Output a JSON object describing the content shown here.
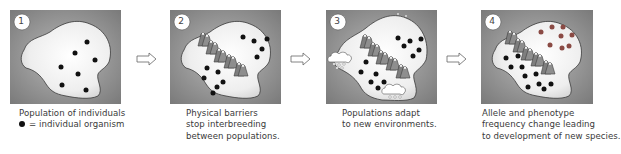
{
  "diagram": {
    "colors": {
      "background_gray": "#8c8c8c",
      "land_light": "#f0f0f0",
      "land_outline": "#3a3a3a",
      "organism_original": "#111111",
      "organism_new": "#8a4a44",
      "mountain": "#8a8a8a",
      "caption_text": "#3a3a3a"
    },
    "steps": [
      {
        "number": "1",
        "caption_lines": [
          "Population of individuals"
        ],
        "legend": {
          "symbol": "dot",
          "text": "= individual organism"
        }
      },
      {
        "number": "2",
        "caption_lines": [
          "Physical barriers",
          "stop interbreeding",
          "between populations."
        ]
      },
      {
        "number": "3",
        "caption_lines": [
          "Populations adapt",
          "to new environments."
        ]
      },
      {
        "number": "4",
        "caption_lines": [
          "Allele and phenotype",
          "frequency change leading",
          "to development of new species."
        ]
      }
    ],
    "arrows": [
      {
        "from": "1",
        "to": "2",
        "icon": "right-arrow-outline-icon"
      },
      {
        "from": "2",
        "to": "3",
        "icon": "right-arrow-outline-icon"
      },
      {
        "from": "3",
        "to": "4",
        "icon": "right-arrow-outline-icon"
      }
    ]
  }
}
